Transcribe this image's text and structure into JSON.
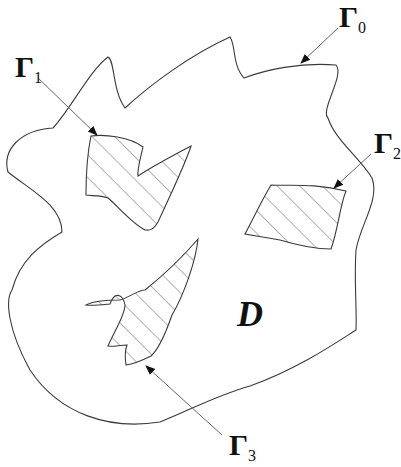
{
  "diagram": {
    "type": "domain-with-holes",
    "domain_label": "D",
    "boundaries": [
      {
        "id": "outer",
        "symbol": "Γ",
        "subscript": "0",
        "description": "outer boundary"
      },
      {
        "id": "hole1",
        "symbol": "Γ",
        "subscript": "1",
        "description": "hatched inclusion (upper left)"
      },
      {
        "id": "hole2",
        "symbol": "Γ",
        "subscript": "2",
        "description": "hatched inclusion (right)"
      },
      {
        "id": "hole3",
        "symbol": "Γ",
        "subscript": "3",
        "description": "hatched inclusion (lower, spiky)"
      }
    ],
    "colors": {
      "stroke": "#3a3a3a",
      "hatch": "#555555",
      "background": "#ffffff"
    }
  }
}
